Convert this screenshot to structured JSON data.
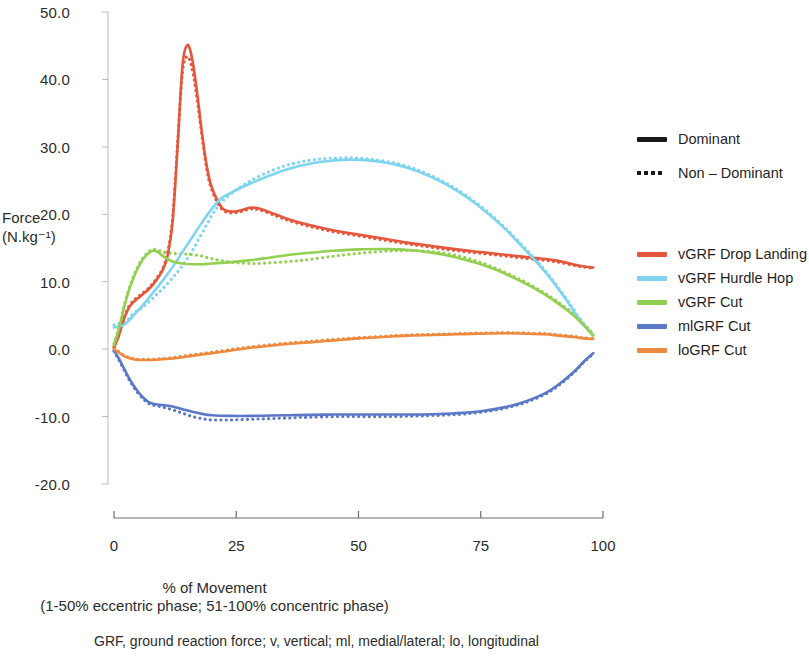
{
  "chart_data": {
    "type": "line",
    "title": "",
    "xlabel": "% of Movement",
    "xlabel_sub": "(1-50% eccentric phase; 51-100% concentric phase)",
    "ylabel_line1": "Force",
    "ylabel_line2": "(N.kg⁻¹)",
    "xlim": [
      0,
      100
    ],
    "ylim": [
      -20.0,
      50.0
    ],
    "grid": false,
    "legend_position": "right",
    "x_ticks": [
      "0",
      "25",
      "50",
      "75",
      "100"
    ],
    "x_tick_values": [
      0,
      25,
      50,
      75,
      100
    ],
    "y_ticks": [
      "50.0",
      "40.0",
      "30.0",
      "20.0",
      "10.0",
      "0.0",
      "-10.0",
      "-20.0"
    ],
    "y_tick_values": [
      50,
      40,
      30,
      20,
      10,
      0,
      -10,
      -20
    ],
    "caption": "GRF, ground reaction force; v, vertical; ml, medial/lateral; lo, longitudinal",
    "linestyle_legend": [
      {
        "label": "Dominant",
        "style": "solid"
      },
      {
        "label": "Non – Dominant",
        "style": "dotted"
      }
    ],
    "series": [
      {
        "name": "vGRF Drop Landing",
        "color": "#E4573C",
        "x": [
          0,
          1,
          2,
          3,
          4,
          5,
          6,
          7,
          8,
          9,
          10,
          11,
          12,
          13,
          14,
          15,
          16,
          17,
          18,
          19,
          20,
          22,
          24,
          26,
          28,
          30,
          33,
          36,
          40,
          45,
          50,
          55,
          60,
          65,
          70,
          75,
          80,
          85,
          90,
          95,
          98
        ],
        "values": [
          0.2,
          2.0,
          4.4,
          6.1,
          7.0,
          7.6,
          8.2,
          8.8,
          9.6,
          10.6,
          11.8,
          14.0,
          19.0,
          30.0,
          42.0,
          45.1,
          43.0,
          38.0,
          32.0,
          27.0,
          24.0,
          21.0,
          20.4,
          20.6,
          21.0,
          20.8,
          20.0,
          19.2,
          18.4,
          17.6,
          17.0,
          16.4,
          15.8,
          15.3,
          14.8,
          14.4,
          14.0,
          13.6,
          13.2,
          12.4,
          12.1
        ],
        "style": "solid",
        "phase": "Dominant"
      },
      {
        "name": "vGRF Drop Landing",
        "color": "#E4573C",
        "x": [
          0,
          1,
          2,
          3,
          4,
          5,
          6,
          7,
          8,
          9,
          10,
          11,
          12,
          13,
          14,
          15,
          16,
          17,
          18,
          19,
          20,
          22,
          24,
          26,
          28,
          30,
          33,
          36,
          40,
          45,
          50,
          55,
          60,
          65,
          70,
          75,
          80,
          85,
          90,
          95,
          98
        ],
        "values": [
          0.4,
          2.2,
          4.6,
          6.3,
          7.2,
          7.8,
          8.4,
          9.0,
          9.8,
          10.8,
          12.0,
          14.4,
          19.6,
          30.5,
          41.0,
          43.4,
          41.5,
          37.0,
          31.5,
          26.6,
          23.6,
          20.8,
          20.2,
          20.4,
          20.8,
          20.6,
          19.8,
          19.0,
          18.2,
          17.4,
          16.8,
          16.2,
          15.6,
          15.1,
          14.6,
          14.2,
          13.8,
          13.4,
          13.0,
          12.3,
          12.0
        ],
        "style": "dotted",
        "phase": "Non – Dominant"
      },
      {
        "name": "vGRF Hurdle Hop",
        "color": "#7FD4EE",
        "x": [
          0,
          1,
          2,
          3,
          4,
          6,
          8,
          10,
          12,
          14,
          16,
          18,
          20,
          22,
          25,
          28,
          32,
          36,
          40,
          44,
          48,
          52,
          56,
          60,
          64,
          68,
          72,
          76,
          80,
          84,
          88,
          92,
          95,
          97,
          98
        ],
        "values": [
          3.2,
          3.4,
          3.6,
          4.2,
          5.0,
          6.6,
          8.4,
          10.2,
          12.2,
          14.4,
          16.6,
          18.8,
          20.8,
          22.4,
          23.6,
          24.6,
          25.8,
          26.8,
          27.5,
          27.9,
          28.1,
          28.0,
          27.6,
          26.9,
          25.8,
          24.4,
          22.6,
          20.4,
          17.8,
          14.8,
          11.6,
          7.8,
          4.6,
          2.8,
          2.1
        ],
        "style": "solid",
        "phase": "Dominant"
      },
      {
        "name": "vGRF Hurdle Hop",
        "color": "#7FD4EE",
        "x": [
          0,
          1,
          2,
          3,
          4,
          6,
          8,
          10,
          12,
          14,
          16,
          18,
          20,
          22,
          25,
          28,
          32,
          36,
          40,
          44,
          48,
          52,
          56,
          60,
          64,
          68,
          72,
          76,
          80,
          84,
          88,
          92,
          95,
          97,
          98
        ],
        "values": [
          3.6,
          3.8,
          4.0,
          4.5,
          5.3,
          6.3,
          7.6,
          9.0,
          10.6,
          12.4,
          14.6,
          17.2,
          19.8,
          21.8,
          23.6,
          25.0,
          26.4,
          27.4,
          28.0,
          28.3,
          28.4,
          28.2,
          27.8,
          27.1,
          26.0,
          24.6,
          22.8,
          20.6,
          18.0,
          15.0,
          11.8,
          8.0,
          4.8,
          3.0,
          2.3
        ],
        "style": "dotted",
        "phase": "Non – Dominant"
      },
      {
        "name": "vGRF Cut",
        "color": "#93D052",
        "x": [
          0,
          1,
          2,
          3,
          4,
          5,
          6,
          7,
          8,
          9,
          10,
          12,
          14,
          16,
          18,
          20,
          24,
          28,
          32,
          36,
          40,
          45,
          50,
          55,
          58,
          62,
          66,
          70,
          74,
          78,
          82,
          86,
          90,
          94,
          97,
          98
        ],
        "values": [
          0.6,
          3.0,
          6.0,
          8.6,
          10.6,
          12.2,
          13.4,
          14.2,
          14.6,
          14.4,
          13.8,
          13.0,
          12.7,
          12.6,
          12.6,
          12.7,
          12.9,
          13.2,
          13.6,
          14.0,
          14.3,
          14.6,
          14.8,
          14.85,
          14.8,
          14.6,
          14.2,
          13.6,
          12.8,
          11.8,
          10.5,
          9.0,
          7.2,
          5.0,
          2.8,
          2.0
        ],
        "style": "solid",
        "phase": "Dominant"
      },
      {
        "name": "vGRF Cut",
        "color": "#93D052",
        "x": [
          0,
          1,
          2,
          3,
          4,
          5,
          6,
          7,
          8,
          9,
          10,
          12,
          14,
          16,
          18,
          20,
          24,
          28,
          32,
          36,
          40,
          45,
          50,
          55,
          58,
          62,
          66,
          70,
          74,
          78,
          82,
          86,
          90,
          94,
          97,
          98
        ],
        "values": [
          0.8,
          3.2,
          6.2,
          8.8,
          10.8,
          12.4,
          13.6,
          14.4,
          14.8,
          14.7,
          14.4,
          14.2,
          14.1,
          14.0,
          13.8,
          13.4,
          12.9,
          12.7,
          12.8,
          13.0,
          13.3,
          13.8,
          14.2,
          14.5,
          14.6,
          14.6,
          14.4,
          13.9,
          13.1,
          12.0,
          10.7,
          9.2,
          7.4,
          5.2,
          3.0,
          2.2
        ],
        "style": "dotted",
        "phase": "Non – Dominant"
      },
      {
        "name": "mlGRF Cut",
        "color": "#5B78C8",
        "x": [
          0,
          1,
          2,
          3,
          4,
          5,
          6,
          7,
          8,
          10,
          12,
          14,
          16,
          18,
          20,
          24,
          28,
          32,
          36,
          40,
          45,
          50,
          55,
          60,
          65,
          70,
          75,
          80,
          84,
          88,
          91,
          94,
          96,
          98
        ],
        "values": [
          -0.2,
          -1.4,
          -2.8,
          -4.2,
          -5.4,
          -6.4,
          -7.2,
          -7.8,
          -8.1,
          -8.3,
          -8.5,
          -8.9,
          -9.3,
          -9.6,
          -9.8,
          -9.9,
          -9.9,
          -9.85,
          -9.8,
          -9.75,
          -9.7,
          -9.7,
          -9.7,
          -9.7,
          -9.65,
          -9.5,
          -9.2,
          -8.6,
          -7.8,
          -6.6,
          -5.2,
          -3.4,
          -1.9,
          -0.6
        ],
        "style": "solid",
        "phase": "Dominant"
      },
      {
        "name": "mlGRF Cut",
        "color": "#5B78C8",
        "x": [
          0,
          1,
          2,
          3,
          4,
          5,
          6,
          7,
          8,
          10,
          12,
          14,
          16,
          18,
          20,
          24,
          28,
          32,
          36,
          40,
          45,
          50,
          55,
          60,
          65,
          70,
          75,
          80,
          84,
          88,
          91,
          94,
          96,
          98
        ],
        "values": [
          -0.3,
          -1.6,
          -3.0,
          -4.4,
          -5.6,
          -6.6,
          -7.4,
          -8.0,
          -8.3,
          -8.6,
          -9.0,
          -9.5,
          -10.0,
          -10.3,
          -10.5,
          -10.5,
          -10.4,
          -10.3,
          -10.2,
          -10.1,
          -10.0,
          -10.0,
          -10.0,
          -9.95,
          -9.85,
          -9.7,
          -9.35,
          -8.75,
          -7.95,
          -6.75,
          -5.35,
          -3.5,
          -2.0,
          -0.7
        ],
        "style": "dotted",
        "phase": "Non – Dominant"
      },
      {
        "name": "loGRF Cut",
        "color": "#EE8A3E",
        "x": [
          0,
          1,
          2,
          3,
          4,
          5,
          6,
          8,
          10,
          12,
          14,
          16,
          18,
          20,
          24,
          28,
          32,
          36,
          40,
          45,
          50,
          55,
          60,
          65,
          70,
          75,
          80,
          84,
          88,
          91,
          94,
          96,
          98
        ],
        "values": [
          0.0,
          -0.5,
          -1.0,
          -1.3,
          -1.5,
          -1.6,
          -1.6,
          -1.6,
          -1.5,
          -1.4,
          -1.2,
          -1.0,
          -0.8,
          -0.6,
          -0.2,
          0.2,
          0.5,
          0.8,
          1.0,
          1.3,
          1.6,
          1.8,
          2.0,
          2.1,
          2.2,
          2.3,
          2.35,
          2.3,
          2.2,
          2.0,
          1.8,
          1.6,
          1.5
        ],
        "style": "solid",
        "phase": "Dominant"
      },
      {
        "name": "loGRF Cut",
        "color": "#EE8A3E",
        "x": [
          0,
          1,
          2,
          3,
          4,
          5,
          6,
          8,
          10,
          12,
          14,
          16,
          18,
          20,
          24,
          28,
          32,
          36,
          40,
          45,
          50,
          55,
          60,
          65,
          70,
          75,
          80,
          84,
          88,
          91,
          94,
          96,
          98
        ],
        "values": [
          0.1,
          -0.4,
          -0.9,
          -1.2,
          -1.4,
          -1.5,
          -1.5,
          -1.5,
          -1.4,
          -1.25,
          -1.05,
          -0.85,
          -0.65,
          -0.45,
          -0.05,
          0.35,
          0.65,
          0.95,
          1.15,
          1.45,
          1.7,
          1.9,
          2.1,
          2.2,
          2.3,
          2.4,
          2.45,
          2.4,
          2.3,
          2.1,
          1.9,
          1.7,
          1.6
        ],
        "style": "dotted",
        "phase": "Non – Dominant"
      }
    ],
    "legend_entries": [
      {
        "label": "vGRF Drop Landing",
        "color": "#E4573C"
      },
      {
        "label": "vGRF Hurdle Hop",
        "color": "#7FD4EE"
      },
      {
        "label": "vGRF Cut",
        "color": "#93D052"
      },
      {
        "label": "mlGRF Cut",
        "color": "#5B78C8"
      },
      {
        "label": "loGRF Cut",
        "color": "#EE8A3E"
      }
    ]
  }
}
